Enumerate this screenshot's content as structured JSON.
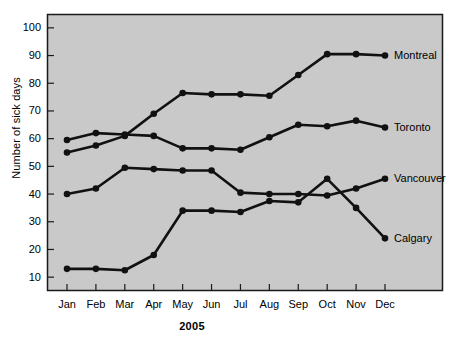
{
  "chart_data": {
    "type": "line",
    "title": "",
    "xlabel": "2005",
    "ylabel": "Number of sick days",
    "categories": [
      "Jan",
      "Feb",
      "Mar",
      "Apr",
      "May",
      "Jun",
      "Jul",
      "Aug",
      "Sep",
      "Oct",
      "Nov",
      "Dec"
    ],
    "ylim": [
      5,
      105
    ],
    "yticks": [
      10,
      20,
      30,
      40,
      50,
      60,
      70,
      80,
      90,
      100
    ],
    "grid": false,
    "legend_position": "inline-right-of-line-end",
    "series": [
      {
        "name": "Montreal",
        "values": [
          55,
          57.5,
          61,
          69,
          76.5,
          76,
          76,
          75.5,
          83,
          90.5,
          90.5,
          90
        ]
      },
      {
        "name": "Toronto",
        "values": [
          59.5,
          62,
          61.5,
          61,
          56.5,
          56.5,
          56,
          60.5,
          65,
          64.5,
          66.5,
          64
        ]
      },
      {
        "name": "Vancouver",
        "values": [
          40,
          42,
          49.5,
          49,
          48.5,
          48.5,
          40.5,
          40,
          40,
          39.5,
          42,
          45.5
        ]
      },
      {
        "name": "Calgary",
        "values": [
          13,
          13,
          12.5,
          18,
          34,
          34,
          33.5,
          37.5,
          37,
          45.5,
          35,
          24
        ]
      }
    ],
    "style": {
      "plot_background": "#c9c9c9",
      "plot_border": "#1a1a1a",
      "line_color": "#111111",
      "marker_color": "#111111",
      "page_background": "#ffffff"
    }
  }
}
